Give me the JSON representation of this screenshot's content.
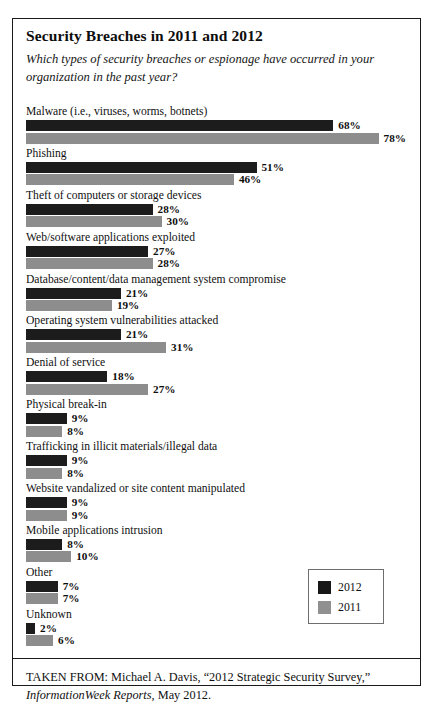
{
  "title": "Security Breaches in 2011 and 2012",
  "subtitle": "Which types of security breaches or espionage have occurred in your organization in the past year?",
  "legend": {
    "items": [
      {
        "label": "2012",
        "color": "#1c1c1c"
      },
      {
        "label": "2011",
        "color": "#8d8d8d"
      }
    ]
  },
  "source": {
    "prefix": "TAKEN FROM: Michael A. Davis, “2012 Strategic Security Survey,”",
    "publication": "InformationWeek Reports",
    "suffix": ", May 2012."
  },
  "chart_data": {
    "type": "bar",
    "title": "Security Breaches in 2011 and 2012",
    "subtitle": "Which types of security breaches or espionage have occurred in your organization in the past year?",
    "orientation": "horizontal",
    "xlabel": "",
    "ylabel": "",
    "xlim": [
      0,
      80
    ],
    "grid": false,
    "legend_position": "bottom-right",
    "value_suffix": "%",
    "categories": [
      "Malware (i.e., viruses, worms, botnets)",
      "Phishing",
      "Theft of computers or storage devices",
      "Web/software applications exploited",
      "Database/content/data management system compromise",
      "Operating system vulnerabilities attacked",
      "Denial of service",
      "Physical break-in",
      "Trafficking in illicit materials/illegal data",
      "Website vandalized or site content manipulated",
      "Mobile applications intrusion",
      "Other",
      "Unknown"
    ],
    "series": [
      {
        "name": "2012",
        "color": "#1c1c1c",
        "values": [
          68,
          51,
          28,
          27,
          21,
          21,
          18,
          9,
          9,
          9,
          8,
          7,
          2
        ],
        "labels": [
          "68%",
          "51%",
          "28%",
          "27%",
          "21%",
          "21%",
          "18%",
          "9%",
          "9%",
          "9%",
          "8%",
          "7%",
          "2%"
        ]
      },
      {
        "name": "2011",
        "color": "#8d8d8d",
        "values": [
          78,
          46,
          30,
          28,
          19,
          31,
          27,
          8,
          8,
          9,
          10,
          7,
          6
        ],
        "labels": [
          "78%",
          "46%",
          "30%",
          "28%",
          "19%",
          "31%",
          "27%",
          "8%",
          "8%",
          "9%",
          "10%",
          "7%",
          "6%"
        ]
      }
    ]
  }
}
